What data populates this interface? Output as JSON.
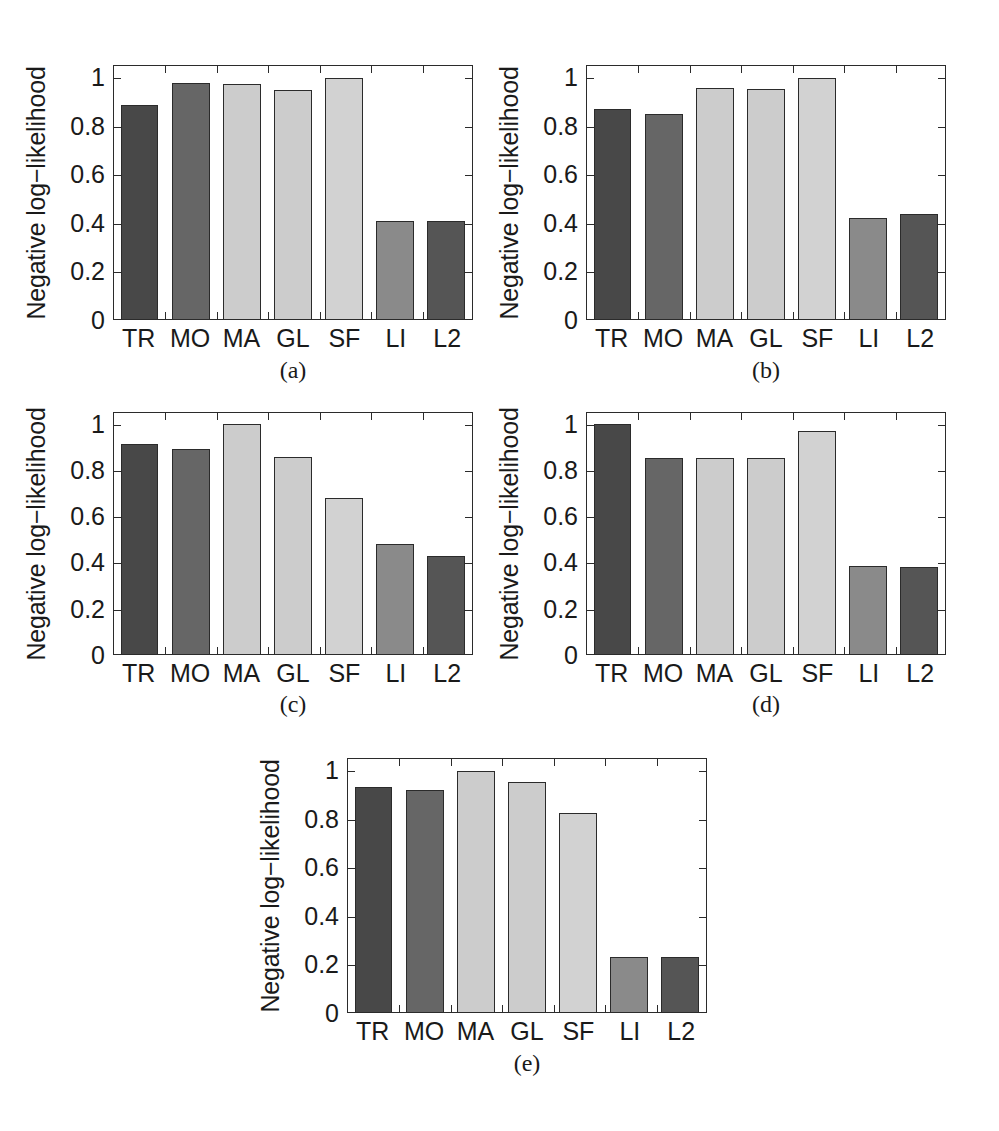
{
  "figure": {
    "width": 999,
    "height": 1131,
    "background": "#ffffff"
  },
  "style": {
    "axis_color": "#2b2b2b",
    "text_color": "#1a1a1a",
    "bar_colors": {
      "TR": "#484848",
      "MO": "#666666",
      "MA": "#cccccc",
      "GL": "#cccccc",
      "SF": "#d2d2d2",
      "LI": "#8a8a8a",
      "L2": "#555555"
    }
  },
  "axis": {
    "ylabel": "Negative log−likelihood",
    "ytick_labels": [
      "0",
      "0.2",
      "0.4",
      "0.6",
      "0.8",
      "1"
    ],
    "ytick_values": [
      0,
      0.2,
      0.4,
      0.6,
      0.8,
      1
    ],
    "ylim": [
      0,
      1.05
    ],
    "categories": [
      "TR",
      "MO",
      "MA",
      "GL",
      "SF",
      "LI",
      "L2"
    ]
  },
  "captions": {
    "a": "(a)",
    "b": "(b)",
    "c": "(c)",
    "d": "(d)",
    "e": "(e)"
  },
  "chart_data": [
    {
      "id": "a",
      "type": "bar",
      "title": "(a)",
      "xlabel": "",
      "ylabel": "Negative log−likelihood",
      "categories": [
        "TR",
        "MO",
        "MA",
        "GL",
        "SF",
        "LI",
        "L2"
      ],
      "values": [
        0.89,
        0.98,
        0.975,
        0.95,
        1.0,
        0.405,
        0.405
      ],
      "ylim": [
        0,
        1.05
      ],
      "yticks": [
        0,
        0.2,
        0.4,
        0.6,
        0.8,
        1
      ],
      "grid": false,
      "legend": "none"
    },
    {
      "id": "b",
      "type": "bar",
      "title": "(b)",
      "xlabel": "",
      "ylabel": "Negative log−likelihood",
      "categories": [
        "TR",
        "MO",
        "MA",
        "GL",
        "SF",
        "LI",
        "L2"
      ],
      "values": [
        0.87,
        0.85,
        0.96,
        0.955,
        1.0,
        0.42,
        0.435
      ],
      "ylim": [
        0,
        1.05
      ],
      "yticks": [
        0,
        0.2,
        0.4,
        0.6,
        0.8,
        1
      ],
      "grid": false,
      "legend": "none"
    },
    {
      "id": "c",
      "type": "bar",
      "title": "(c)",
      "xlabel": "",
      "ylabel": "Negative log−likelihood",
      "categories": [
        "TR",
        "MO",
        "MA",
        "GL",
        "SF",
        "LI",
        "L2"
      ],
      "values": [
        0.915,
        0.895,
        1.0,
        0.86,
        0.68,
        0.48,
        0.425
      ],
      "ylim": [
        0,
        1.05
      ],
      "yticks": [
        0,
        0.2,
        0.4,
        0.6,
        0.8,
        1
      ],
      "grid": false,
      "legend": "none"
    },
    {
      "id": "d",
      "type": "bar",
      "title": "(d)",
      "xlabel": "",
      "ylabel": "Negative log−likelihood",
      "categories": [
        "TR",
        "MO",
        "MA",
        "GL",
        "SF",
        "LI",
        "L2"
      ],
      "values": [
        1.0,
        0.855,
        0.855,
        0.855,
        0.97,
        0.385,
        0.38
      ],
      "ylim": [
        0,
        1.05
      ],
      "yticks": [
        0,
        0.2,
        0.4,
        0.6,
        0.8,
        1
      ],
      "grid": false,
      "legend": "none"
    },
    {
      "id": "e",
      "type": "bar",
      "title": "(e)",
      "xlabel": "",
      "ylabel": "Negative log−likelihood",
      "categories": [
        "TR",
        "MO",
        "MA",
        "GL",
        "SF",
        "LI",
        "L2"
      ],
      "values": [
        0.935,
        0.92,
        1.0,
        0.955,
        0.825,
        0.23,
        0.23
      ],
      "ylim": [
        0,
        1.05
      ],
      "yticks": [
        0,
        0.2,
        0.4,
        0.6,
        0.8,
        1
      ],
      "grid": false,
      "legend": "none"
    }
  ],
  "layout": {
    "panels": [
      {
        "id": "a",
        "plot": {
          "left": 113,
          "top": 65,
          "width": 360,
          "height": 255
        },
        "ylabel_x": 36,
        "ylabel_center_y": 193,
        "caption_center_x": 293,
        "caption_y": 357
      },
      {
        "id": "b",
        "plot": {
          "left": 586,
          "top": 65,
          "width": 360,
          "height": 255
        },
        "ylabel_x": 509,
        "ylabel_center_y": 193,
        "caption_center_x": 766,
        "caption_y": 357
      },
      {
        "id": "c",
        "plot": {
          "left": 113,
          "top": 412,
          "width": 360,
          "height": 243
        },
        "ylabel_x": 36,
        "ylabel_center_y": 534,
        "caption_center_x": 293,
        "caption_y": 691
      },
      {
        "id": "d",
        "plot": {
          "left": 586,
          "top": 412,
          "width": 360,
          "height": 243
        },
        "ylabel_x": 509,
        "ylabel_center_y": 534,
        "caption_center_x": 766,
        "caption_y": 691
      },
      {
        "id": "e",
        "plot": {
          "left": 347,
          "top": 758,
          "width": 360,
          "height": 255
        },
        "ylabel_x": 270,
        "ylabel_center_y": 886,
        "caption_center_x": 527,
        "caption_y": 1050
      }
    ]
  }
}
